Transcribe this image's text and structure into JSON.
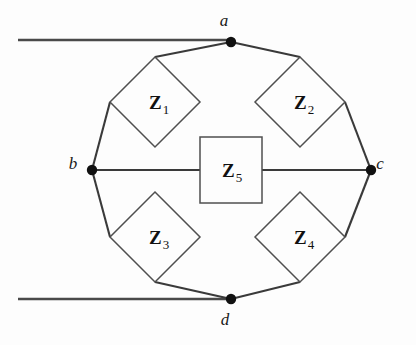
{
  "figure": {
    "background_color": "#fdfdfd",
    "line_color": "#3a3a3a",
    "component_stroke_color": "#4f4f4f",
    "node_color": "#111111",
    "width": 416,
    "height": 345
  },
  "nodes": [
    {
      "id": "a",
      "label": "a",
      "x": 231,
      "y": 42,
      "label_x": 224,
      "label_y": 26
    },
    {
      "id": "b",
      "label": "b",
      "x": 92,
      "y": 170,
      "label_x": 73,
      "label_y": 169
    },
    {
      "id": "c",
      "label": "c",
      "x": 371,
      "y": 170,
      "label_x": 380,
      "label_y": 169
    },
    {
      "id": "d",
      "label": "d",
      "x": 231,
      "y": 299,
      "label_x": 225,
      "label_y": 325
    }
  ],
  "components": [
    {
      "id": "Z1",
      "letter": "Z",
      "subscript": "1",
      "shape": "diamond",
      "cx": 155,
      "cy": 102,
      "half": 45,
      "label_x": 149,
      "label_y": 109
    },
    {
      "id": "Z2",
      "letter": "Z",
      "subscript": "2",
      "shape": "diamond",
      "cx": 300,
      "cy": 102,
      "half": 45,
      "label_x": 294,
      "label_y": 109
    },
    {
      "id": "Z3",
      "letter": "Z",
      "subscript": "3",
      "shape": "diamond",
      "cx": 155,
      "cy": 237,
      "half": 45,
      "label_x": 149,
      "label_y": 244
    },
    {
      "id": "Z4",
      "letter": "Z",
      "subscript": "4",
      "shape": "diamond",
      "cx": 300,
      "cy": 237,
      "half": 45,
      "label_x": 294,
      "label_y": 244
    },
    {
      "id": "Z5",
      "letter": "Z",
      "subscript": "5",
      "shape": "rectangle",
      "cx": 231,
      "cy": 170,
      "w": 62,
      "h": 66,
      "label_x": 222,
      "label_y": 177
    }
  ],
  "leads": [
    {
      "id": "top-left-lead",
      "x1": 18,
      "y1": 40,
      "x2": 231,
      "y2": 40
    },
    {
      "id": "bottom-left-lead",
      "x1": 18,
      "y1": 299,
      "x2": 231,
      "y2": 299
    }
  ],
  "wires": [
    {
      "id": "a-to-Z1",
      "x1": 231,
      "y1": 42,
      "x2": 155,
      "y2": 57
    },
    {
      "id": "Z1-to-b",
      "x1": 110,
      "y1": 102,
      "x2": 92,
      "y2": 170
    },
    {
      "id": "a-to-Z2",
      "x1": 231,
      "y1": 42,
      "x2": 300,
      "y2": 57
    },
    {
      "id": "Z2-to-c",
      "x1": 345,
      "y1": 102,
      "x2": 371,
      "y2": 170
    },
    {
      "id": "b-to-Z3",
      "x1": 92,
      "y1": 170,
      "x2": 110,
      "y2": 237
    },
    {
      "id": "Z3-to-d",
      "x1": 155,
      "y1": 282,
      "x2": 231,
      "y2": 299
    },
    {
      "id": "c-to-Z4",
      "x1": 371,
      "y1": 170,
      "x2": 345,
      "y2": 237
    },
    {
      "id": "Z4-to-d",
      "x1": 300,
      "y1": 282,
      "x2": 231,
      "y2": 299
    },
    {
      "id": "b-to-Z5",
      "x1": 92,
      "y1": 170,
      "x2": 200,
      "y2": 170
    },
    {
      "id": "Z5-to-c",
      "x1": 262,
      "y1": 170,
      "x2": 371,
      "y2": 170
    }
  ]
}
